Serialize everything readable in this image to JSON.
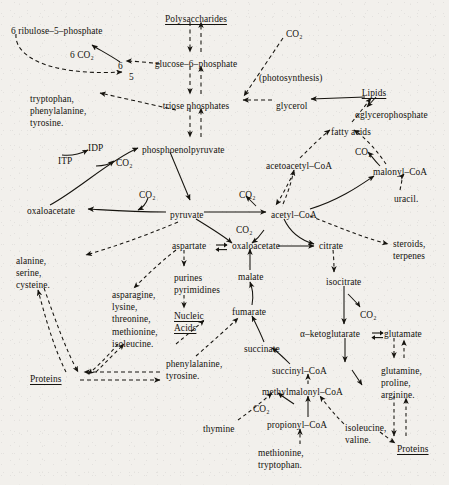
{
  "figure": {
    "kind": "metabolic-pathway-diagram",
    "ink_color": "#15130e",
    "paper_color": "#f2f0ec",
    "legend": {
      "solid_arrow": "catabolic / direct conversion",
      "dashed_arrow": "biosynthetic / multi-step conversion"
    }
  },
  "nodes": [
    {
      "id": "ribulose5p",
      "label": "6 ribulose–5–phosphate",
      "x": 11,
      "y": 26,
      "align": "left",
      "underline": false
    },
    {
      "id": "co2_ppp",
      "label": "6 CO₂",
      "x": 70,
      "y": 50,
      "align": "left",
      "underline": false
    },
    {
      "id": "six",
      "label": "6",
      "x": 118,
      "y": 61,
      "align": "left",
      "underline": false
    },
    {
      "id": "five",
      "label": "5",
      "x": 129,
      "y": 72,
      "align": "left",
      "underline": false
    },
    {
      "id": "polysaccharides",
      "label": "Polysaccharides",
      "x": 196,
      "y": 14,
      "align": "center",
      "underline": true
    },
    {
      "id": "glucose6p",
      "label": "glucose–6–phosphate",
      "x": 196,
      "y": 59,
      "align": "center",
      "underline": false
    },
    {
      "id": "triose_p",
      "label": "triose phosphates",
      "x": 196,
      "y": 101,
      "align": "center",
      "underline": false
    },
    {
      "id": "co2_photo",
      "label": "CO₂",
      "x": 286,
      "y": 29,
      "align": "left",
      "underline": false
    },
    {
      "id": "photosynthesis",
      "label": "(photosynthesis)",
      "x": 259,
      "y": 73,
      "align": "left",
      "underline": false
    },
    {
      "id": "glycerol",
      "label": "glycerol",
      "x": 276,
      "y": 101,
      "align": "left",
      "underline": false
    },
    {
      "id": "lipids",
      "label": "Lipids",
      "x": 374,
      "y": 88,
      "align": "center",
      "underline": true
    },
    {
      "id": "glycerophosphate",
      "label": "αglycerophosphate",
      "x": 355,
      "y": 110,
      "align": "left",
      "underline": false
    },
    {
      "id": "fatty_acids",
      "label": "fatty acids",
      "x": 331,
      "y": 127,
      "align": "left",
      "underline": false
    },
    {
      "id": "trp_phe_tyr",
      "label": "tryptophan,\nphenylalanine,\ntyrosine.",
      "x": 30,
      "y": 93,
      "align": "left",
      "underline": false
    },
    {
      "id": "idp",
      "label": "IDP",
      "x": 88,
      "y": 143,
      "align": "left",
      "underline": false
    },
    {
      "id": "itp",
      "label": "ITP",
      "x": 58,
      "y": 156,
      "align": "left",
      "underline": false
    },
    {
      "id": "co2_pepck",
      "label": "CO₂",
      "x": 116,
      "y": 158,
      "align": "left",
      "underline": false
    },
    {
      "id": "pep",
      "label": "phosphoenolpyruvate",
      "x": 142,
      "y": 145,
      "align": "left",
      "underline": false
    },
    {
      "id": "acetoacetyl_coa",
      "label": "acetoacetyl–CoA",
      "x": 266,
      "y": 161,
      "align": "left",
      "underline": false
    },
    {
      "id": "co2_malonyl",
      "label": "CO₂",
      "x": 355,
      "y": 147,
      "align": "left",
      "underline": false
    },
    {
      "id": "malonyl_coa",
      "label": "malonyl–CoA",
      "x": 373,
      "y": 167,
      "align": "left",
      "underline": false
    },
    {
      "id": "uracil",
      "label": "uracil.",
      "x": 394,
      "y": 194,
      "align": "left",
      "underline": false
    },
    {
      "id": "co2_pc",
      "label": "CO₂",
      "x": 139,
      "y": 190,
      "align": "left",
      "underline": false
    },
    {
      "id": "co2_pdh",
      "label": "CO₂",
      "x": 239,
      "y": 190,
      "align": "left",
      "underline": false
    },
    {
      "id": "oxaloacetate_l",
      "label": "oxaloacetate",
      "x": 27,
      "y": 206,
      "align": "left",
      "underline": false
    },
    {
      "id": "pyruvate",
      "label": "pyruvate",
      "x": 170,
      "y": 210,
      "align": "left",
      "underline": false
    },
    {
      "id": "acetyl_coa",
      "label": "acetyl–CoA",
      "x": 271,
      "y": 210,
      "align": "left",
      "underline": false
    },
    {
      "id": "co2_me",
      "label": "CO₂",
      "x": 236,
      "y": 225,
      "align": "left",
      "underline": false
    },
    {
      "id": "aspartate",
      "label": "aspartate",
      "x": 172,
      "y": 241,
      "align": "left",
      "underline": false
    },
    {
      "id": "oxaloacetate_r",
      "label": "oxaloacetate",
      "x": 232,
      "y": 241,
      "align": "left",
      "underline": false
    },
    {
      "id": "citrate",
      "label": "citrate",
      "x": 319,
      "y": 241,
      "align": "left",
      "underline": false
    },
    {
      "id": "steroids",
      "label": "steroids,\nterpenes",
      "x": 393,
      "y": 238,
      "align": "left",
      "underline": false
    },
    {
      "id": "alanine_group",
      "label": "alanine,\nserine,\ncysteine.",
      "x": 16,
      "y": 255,
      "align": "left",
      "underline": false
    },
    {
      "id": "purines_pyr",
      "label": "purines\npyrimidines",
      "x": 174,
      "y": 272,
      "align": "left",
      "underline": false
    },
    {
      "id": "malate",
      "label": "malate",
      "x": 238,
      "y": 272,
      "align": "left",
      "underline": false
    },
    {
      "id": "isocitrate",
      "label": "isocitrate",
      "x": 326,
      "y": 277,
      "align": "left",
      "underline": false
    },
    {
      "id": "asparagine_group",
      "label": "asparagine,\nlysine,\nthreonine,\nmethionine,\nisoleucine.",
      "x": 112,
      "y": 289,
      "align": "left",
      "underline": false
    },
    {
      "id": "nucleic_acids",
      "label": "Nucleic\nAcids",
      "x": 174,
      "y": 310,
      "align": "left",
      "underline": true
    },
    {
      "id": "fumarate",
      "label": "fumarate",
      "x": 232,
      "y": 307,
      "align": "left",
      "underline": false
    },
    {
      "id": "co2_icdh",
      "label": "CO₂",
      "x": 360,
      "y": 310,
      "align": "left",
      "underline": false
    },
    {
      "id": "ketoglutarate",
      "label": "α–ketoglutarate",
      "x": 300,
      "y": 329,
      "align": "left",
      "underline": false
    },
    {
      "id": "glutamate",
      "label": "glutamate",
      "x": 384,
      "y": 329,
      "align": "left",
      "underline": false
    },
    {
      "id": "succinate",
      "label": "succinate",
      "x": 244,
      "y": 344,
      "align": "left",
      "underline": false
    },
    {
      "id": "phe_tyr",
      "label": "phenylalanine,\ntyrosine.",
      "x": 166,
      "y": 358,
      "align": "left",
      "underline": false
    },
    {
      "id": "succinyl_coa",
      "label": "succinyl–CoA",
      "x": 272,
      "y": 366,
      "align": "left",
      "underline": false
    },
    {
      "id": "glutamine_group",
      "label": "glutamine,\nproline,\narginine.",
      "x": 381,
      "y": 365,
      "align": "left",
      "underline": false
    },
    {
      "id": "proteins_left",
      "label": "Proteins",
      "x": 30,
      "y": 374,
      "align": "left",
      "underline": true
    },
    {
      "id": "methylmalonyl",
      "label": "methylmalonyl–CoA",
      "x": 262,
      "y": 387,
      "align": "left",
      "underline": false
    },
    {
      "id": "co2_pcc",
      "label": "CO₂",
      "x": 253,
      "y": 404,
      "align": "left",
      "underline": false
    },
    {
      "id": "propionyl_coa",
      "label": "propionyl–CoA",
      "x": 267,
      "y": 420,
      "align": "left",
      "underline": false
    },
    {
      "id": "thymine",
      "label": "thymine",
      "x": 203,
      "y": 424,
      "align": "left",
      "underline": false
    },
    {
      "id": "ile_val",
      "label": "isoleucine,\nvaline.",
      "x": 345,
      "y": 422,
      "align": "left",
      "underline": false
    },
    {
      "id": "proteins_right",
      "label": "Proteins",
      "x": 397,
      "y": 444,
      "align": "left",
      "underline": true
    },
    {
      "id": "met_trp",
      "label": "methionine,\ntryptophan.",
      "x": 258,
      "y": 447,
      "align": "left",
      "underline": false
    }
  ],
  "edges": [
    {
      "from": "ribulose5p",
      "to": "five",
      "style": "dashed",
      "note": "pentose phosphate cycle"
    },
    {
      "from": "six",
      "to": "co2_ppp",
      "style": "solid",
      "note": "decarboxylation"
    },
    {
      "from": "glucose6p",
      "to": "six",
      "style": "dashed",
      "note": "hexose to pentose"
    },
    {
      "from": "polysaccharides",
      "to": "glucose6p",
      "style": "dashed",
      "note": "glycogenolysis"
    },
    {
      "from": "glucose6p",
      "to": "polysaccharides",
      "style": "dashed",
      "note": "glycogenesis"
    },
    {
      "from": "glucose6p",
      "to": "triose_p",
      "style": "dashed",
      "note": "glycolysis"
    },
    {
      "from": "triose_p",
      "to": "glucose6p",
      "style": "dashed",
      "note": "gluconeogenesis"
    },
    {
      "from": "co2_photo",
      "to": "triose_p",
      "style": "dashed",
      "note": "photosynthesis"
    },
    {
      "from": "glycerol",
      "to": "triose_p",
      "style": "dashed",
      "note": "glycerol entry"
    },
    {
      "from": "lipids",
      "to": "glycerol",
      "style": "solid",
      "note": "lipolysis"
    },
    {
      "from": "lipids",
      "to": "glycerophosphate",
      "style": "solid",
      "note": ""
    },
    {
      "from": "fatty_acids",
      "to": "lipids",
      "style": "dashed",
      "note": "esterification"
    },
    {
      "from": "triose_p",
      "to": "trp_phe_tyr",
      "style": "dashed",
      "note": "aromatic amino acids"
    },
    {
      "from": "triose_p",
      "to": "pep",
      "style": "dashed",
      "note": ""
    },
    {
      "from": "pep",
      "to": "triose_p",
      "style": "dashed",
      "note": ""
    },
    {
      "from": "itp",
      "to": "idp",
      "style": "solid",
      "note": ""
    },
    {
      "from": "oxaloacetate_l",
      "to": "pep",
      "style": "solid",
      "note": "PEP carboxykinase"
    },
    {
      "from": "oxaloacetate_l",
      "to": "co2_pepck",
      "style": "solid",
      "note": ""
    },
    {
      "from": "pep",
      "to": "pyruvate",
      "style": "solid",
      "note": "pyruvate kinase"
    },
    {
      "from": "pyruvate",
      "to": "oxaloacetate_l",
      "style": "solid",
      "note": "pyruvate carboxylase"
    },
    {
      "from": "co2_pc",
      "to": "oxaloacetate_l",
      "style": "solid",
      "note": ""
    },
    {
      "from": "pyruvate",
      "to": "acetyl_coa",
      "style": "solid",
      "note": "pyruvate dehydrogenase"
    },
    {
      "from": "acetyl_coa",
      "to": "co2_pdh",
      "style": "solid",
      "note": ""
    },
    {
      "from": "acetyl_coa",
      "to": "acetoacetyl_coa",
      "style": "dashed",
      "note": "ketogenesis"
    },
    {
      "from": "acetoacetyl_coa",
      "to": "acetyl_coa",
      "style": "dashed",
      "note": ""
    },
    {
      "from": "acetoacetyl_coa",
      "to": "fatty_acids",
      "style": "dashed",
      "note": "fatty acid synthesis"
    },
    {
      "from": "acetyl_coa",
      "to": "malonyl_coa",
      "style": "solid",
      "note": "acetyl-CoA carboxylase"
    },
    {
      "from": "malonyl_coa",
      "to": "fatty_acids",
      "style": "dashed",
      "note": ""
    },
    {
      "from": "malonyl_coa",
      "to": "co2_malonyl",
      "style": "solid",
      "note": ""
    },
    {
      "from": "uracil",
      "to": "malonyl_coa",
      "style": "dashed",
      "note": ""
    },
    {
      "from": "acetyl_coa",
      "to": "steroids",
      "style": "dashed",
      "note": "isoprenoid synthesis"
    },
    {
      "from": "acetyl_coa",
      "to": "citrate",
      "style": "solid",
      "note": "citrate synthase"
    },
    {
      "from": "oxaloacetate_r",
      "to": "citrate",
      "style": "solid",
      "note": ""
    },
    {
      "from": "pyruvate",
      "to": "oxaloacetate_r",
      "style": "solid",
      "note": "malic enzyme, CO2"
    },
    {
      "from": "aspartate",
      "to": "oxaloacetate_r",
      "style": "solid",
      "note": "transamination, reversible"
    },
    {
      "from": "aspartate",
      "to": "purines_pyr",
      "style": "dashed",
      "note": ""
    },
    {
      "from": "purines_pyr",
      "to": "nucleic_acids",
      "style": "dashed",
      "note": ""
    },
    {
      "from": "malate",
      "to": "oxaloacetate_r",
      "style": "solid",
      "note": "malate dehydrogenase"
    },
    {
      "from": "fumarate",
      "to": "malate",
      "style": "solid",
      "note": "fumarase"
    },
    {
      "from": "succinate",
      "to": "fumarate",
      "style": "solid",
      "note": "succinate dehydrogenase"
    },
    {
      "from": "succinyl_coa",
      "to": "succinate",
      "style": "solid",
      "note": ""
    },
    {
      "from": "citrate",
      "to": "isocitrate",
      "style": "dashed",
      "note": "aconitase"
    },
    {
      "from": "isocitrate",
      "to": "ketoglutarate",
      "style": "solid",
      "note": "isocitrate dehydrogenase"
    },
    {
      "from": "isocitrate",
      "to": "co2_icdh",
      "style": "solid",
      "note": ""
    },
    {
      "from": "ketoglutarate",
      "to": "glutamate",
      "style": "solid",
      "note": "transamination, reversible"
    },
    {
      "from": "ketoglutarate",
      "to": "succinyl_coa",
      "style": "solid",
      "note": ""
    },
    {
      "from": "ketoglutarate",
      "to": "co2_pcc",
      "style": "solid",
      "note": ""
    },
    {
      "from": "glutamate",
      "to": "glutamine_group",
      "style": "dashed",
      "note": ""
    },
    {
      "from": "glutamine_group",
      "to": "proteins_right",
      "style": "dashed",
      "note": ""
    },
    {
      "from": "methylmalonyl",
      "to": "succinyl_coa",
      "style": "dashed",
      "note": "mutase"
    },
    {
      "from": "propionyl_coa",
      "to": "methylmalonyl",
      "style": "solid",
      "note": "propionyl-CoA carboxylase"
    },
    {
      "from": "thymine",
      "to": "methylmalonyl",
      "style": "dashed",
      "note": ""
    },
    {
      "from": "met_trp",
      "to": "propionyl_coa",
      "style": "dashed",
      "note": ""
    },
    {
      "from": "ile_val",
      "to": "methylmalonyl",
      "style": "dashed",
      "note": ""
    },
    {
      "from": "ile_val",
      "to": "proteins_right",
      "style": "dashed",
      "note": ""
    },
    {
      "from": "pyruvate",
      "to": "alanine_group",
      "style": "dashed",
      "note": ""
    },
    {
      "from": "alanine_group",
      "to": "proteins_left",
      "style": "dashed",
      "note": ""
    },
    {
      "from": "proteins_left",
      "to": "alanine_group",
      "style": "dashed",
      "note": ""
    },
    {
      "from": "aspartate",
      "to": "asparagine_group",
      "style": "dashed",
      "note": ""
    },
    {
      "from": "asparagine_group",
      "to": "proteins_left",
      "style": "dashed",
      "note": ""
    },
    {
      "from": "proteins_left",
      "to": "phe_tyr",
      "style": "dashed",
      "note": ""
    },
    {
      "from": "phe_tyr",
      "to": "fumarate",
      "style": "dashed",
      "note": ""
    }
  ]
}
